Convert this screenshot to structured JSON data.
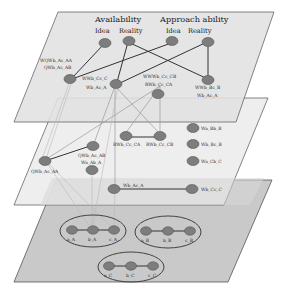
{
  "diagram": {
    "type": "multi-layer network",
    "layers": [
      {
        "name": "top-layer",
        "headings": [
          {
            "title": "Availability",
            "subs": [
              "Idea",
              "Reality"
            ]
          },
          {
            "title": "Approach ability",
            "subs": [
              "Idea",
              "Reality"
            ]
          }
        ],
        "node_labels": {
          "left_line1": "WQWb_Ac_AA",
          "left_line2": "QWb_Ac_AB",
          "mid_line1": "WWb_Cc_C",
          "mid_line2": "Wb_Ac_A",
          "right_mid_line1": "WWWb_Cc_CB",
          "right_mid_line2": "RWb_Cc_CA",
          "right_line1": "WWb_Bc_B",
          "right_line2": "Wb_Ac_A"
        }
      },
      {
        "name": "middle-layer",
        "node_labels": {
          "qwb_ab": "QWb_Ac_AB",
          "qwb_aa": "QWb_Ac_AA",
          "wa_ab": "Wa_Ab_A",
          "rwb_ca": "RWb_Cc_CA",
          "rwb_cb": "RWb_Cc_CB",
          "wa_bb": "Wa_Bb_B",
          "wb_bc": "Wb_Bc_B",
          "wa_cb": "Wa_Cb_C"
        }
      },
      {
        "name": "lower-middle-layer",
        "node_labels": {
          "wb_ac": "Wb_Ac_A",
          "wb_cc": "Wb_Cc_C"
        }
      },
      {
        "name": "bottom-layer",
        "groups": [
          {
            "labels": [
              "a_A",
              "b_A",
              "c_A"
            ]
          },
          {
            "labels": [
              "a_B",
              "b_B",
              "c_B"
            ]
          },
          {
            "labels": [
              "a_C",
              "b_C",
              "c_C"
            ]
          }
        ]
      }
    ]
  }
}
